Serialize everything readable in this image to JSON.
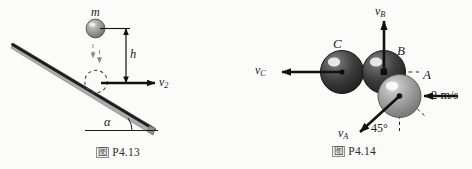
{
  "document": {
    "background_color": "#fbfbf9",
    "ink_color": "#1b1b1b"
  },
  "figures": [
    {
      "id": "p4-13",
      "caption_glyph": "图",
      "caption_text": "P4.13",
      "description": "Ball of mass m dropped from height h onto an inclined plane, rebounding horizontally with speed v2",
      "labels": {
        "mass": "m",
        "height": "h",
        "velocity": "v",
        "velocity_subscript": "2",
        "angle": "α"
      },
      "colors": {
        "incline_face": "#a9a9a9",
        "incline_edge": "#1f1f1f",
        "ball_fill": "#9a9a9a",
        "ball_edge": "#4b4b4b"
      }
    },
    {
      "id": "p4-14",
      "caption_glyph": "图",
      "caption_text": "P4.14",
      "description": "Three spheres A, B and C in contact; sphere A struck at 2 m/s, resulting velocities vA at 45 degrees, vB upward and vC leftward",
      "labels": {
        "sphere_a": "A",
        "sphere_b": "B",
        "sphere_c": "C",
        "velocity_a": "v",
        "velocity_a_subscript": "A",
        "velocity_b": "v",
        "velocity_b_subscript": "B",
        "velocity_c": "v",
        "velocity_c_subscript": "C",
        "incoming_speed": "2 m/s",
        "angle": "45°"
      },
      "colors": {
        "sphere_dark": "#3c3c3c",
        "sphere_light": "#9b9b9b",
        "highlight": "#f4f4f4",
        "arrow": "#111111",
        "dashed": "#2b2b2b"
      }
    }
  ]
}
